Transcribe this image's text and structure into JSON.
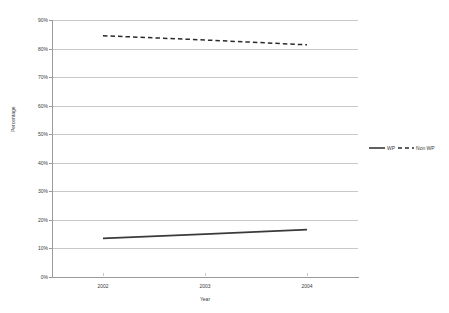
{
  "chart_data": {
    "type": "line",
    "title": "",
    "xlabel": "Year",
    "ylabel": "Percentage",
    "x": [
      "2002",
      "2003",
      "2004"
    ],
    "categories": [
      "2002",
      "2003",
      "2004"
    ],
    "series": [
      {
        "name": "WP",
        "values": [
          13.5,
          15.0,
          16.6
        ],
        "style": "solid",
        "color": "#3a3a3a"
      },
      {
        "name": "Non WP",
        "values": [
          84.5,
          83.0,
          81.3
        ],
        "style": "dashed",
        "color": "#2b2b2b"
      }
    ],
    "ylim": [
      0,
      90
    ],
    "ytick_labels": [
      "90%",
      "80%",
      "70%",
      "60%",
      "50%",
      "40%",
      "30%",
      "20%",
      "10%",
      "0%"
    ],
    "ytick_values": [
      90,
      80,
      70,
      60,
      50,
      40,
      30,
      20,
      10,
      0
    ],
    "xtick_labels": [
      "2002",
      "2003",
      "2004"
    ],
    "grid": "horizontal",
    "legend_position": "right"
  },
  "axes": {
    "y_title": "Percentage",
    "x_title": "Year"
  },
  "legend": {
    "items": [
      {
        "label": "WP"
      },
      {
        "label": "Non WP"
      }
    ]
  },
  "colors": {
    "gridline": "#c9c9c9",
    "axis": "#9a9a9a",
    "series_wp": "#3a3a3a",
    "series_nonwp": "#2b2b2b",
    "text": "#3a3a3a",
    "background": "#ffffff"
  }
}
